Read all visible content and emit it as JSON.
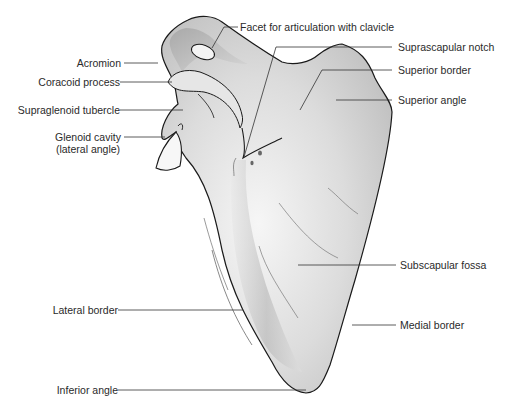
{
  "diagram": {
    "labels": {
      "facet": "Facet for articulation with clavicle",
      "suprascapular_notch": "Suprascapular notch",
      "superior_border": "Superior border",
      "superior_angle": "Superior angle",
      "acromion": "Acromion",
      "coracoid": "Coracoid process",
      "supraglenoid": "Supraglenoid tubercle",
      "glenoid_line1": "Glenoid cavity",
      "glenoid_line2": "(lateral angle)",
      "subscapular_fossa": "Subscapular fossa",
      "lateral_border": "Lateral border",
      "medial_border": "Medial border",
      "inferior_angle": "Inferior angle"
    },
    "colors": {
      "bone_fill_light": "#f2f2f2",
      "bone_fill_dark": "#b9b9b9",
      "outline": "#1a1a1a",
      "leader_line": "#333333",
      "text": "#2a2a2a"
    }
  }
}
